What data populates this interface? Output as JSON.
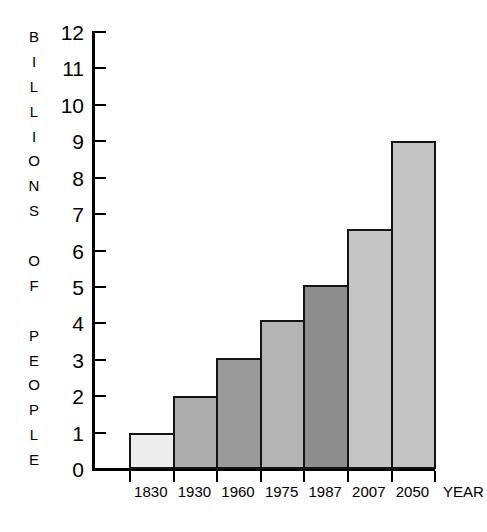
{
  "chart_data": {
    "type": "bar",
    "title": "",
    "subtitle": "",
    "xlabel": "YEAR",
    "ylabel": "BILLIONS OF PEOPLE",
    "ylabel_letters": [
      "B",
      "I",
      "L",
      "L",
      "I",
      "O",
      "N",
      "S",
      "",
      "O",
      "F",
      "",
      "P",
      "E",
      "O",
      "P",
      "L",
      "E"
    ],
    "categories": [
      "1830",
      "1930",
      "1960",
      "1975",
      "1987",
      "2007",
      "2050"
    ],
    "values": [
      1.0,
      2.0,
      3.05,
      4.1,
      5.05,
      6.6,
      9.0
    ],
    "value_unit": "billions",
    "ylim": [
      0,
      12
    ],
    "ytick_labels": [
      "12",
      "11",
      "10",
      "9",
      "8",
      "7",
      "6",
      "5",
      "4",
      "3",
      "2",
      "1",
      "0"
    ],
    "ytick_values": [
      12,
      11,
      10,
      9,
      8,
      7,
      6,
      5,
      4,
      3,
      2,
      1,
      0
    ],
    "grid": false,
    "legend": "none",
    "bar_colors": [
      "#ededed",
      "#adadad",
      "#9a9a9a",
      "#b4b4b4",
      "#8e8e8e",
      "#c6c6c6",
      "#c4c4c4"
    ],
    "bar_edge_color": "#141414",
    "axis_color": "#000000",
    "background": "#ffffff"
  }
}
